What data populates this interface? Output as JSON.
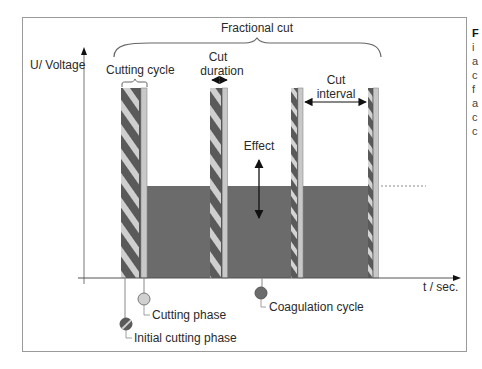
{
  "diagram": {
    "title": "Fractional cut",
    "y_axis_label": "U/ Voltage",
    "x_axis_label": "t / sec.",
    "annotations": {
      "cutting_cycle": "Cutting cycle",
      "cut_duration_line1": "Cut",
      "cut_duration_line2": "duration",
      "cut_interval_line1": "Cut",
      "cut_interval_line2": "interval",
      "effect": "Effect"
    },
    "legend": {
      "cutting_phase": "Cutting phase",
      "initial_cutting_phase": "Initial cutting phase",
      "coagulation_cycle": "Coagulation cycle"
    },
    "colors": {
      "stripe_dark": "#5a5a5a",
      "stripe_light": "#cfcfcf",
      "cutting_phase_strip": "#c8c8c8",
      "coagulation_fill": "#6b6b6b",
      "frame": "#9a9a9a",
      "axis": "#555555"
    },
    "pulses": [
      {
        "name": "pulse-1",
        "stripe_x": 121,
        "stripe_w": 19,
        "light_w": 6
      },
      {
        "name": "pulse-2",
        "stripe_x": 210,
        "stripe_w": 12,
        "light_w": 5
      },
      {
        "name": "pulse-3",
        "stripe_x": 291,
        "stripe_w": 7,
        "light_w": 5
      },
      {
        "name": "pulse-4",
        "stripe_x": 368,
        "stripe_w": 5,
        "light_w": 5
      }
    ]
  },
  "side_caption": {
    "lines": [
      "F",
      "i",
      "a",
      "c",
      "f",
      "a",
      "c",
      "c"
    ]
  }
}
